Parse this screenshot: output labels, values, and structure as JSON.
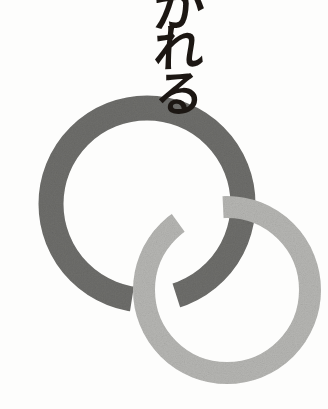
{
  "canvas": {
    "width": 328,
    "height": 409,
    "background_color": "#fdfdfc"
  },
  "caption": {
    "text": "かれる",
    "reading": "kareru",
    "orientation": "vertical",
    "color": "#1c1713",
    "characters": [
      "か",
      "れ",
      "る"
    ],
    "note": "top character is cropped by the top edge of the image"
  },
  "artwork": {
    "name": "two interlocking rings",
    "style": "halftone screened print",
    "rings": [
      {
        "id": "dark-ring",
        "label": "large dark gray ring",
        "color": "#6e6e6b",
        "center_x": 147,
        "center_y": 204,
        "radius": 96,
        "stroke_width": 25,
        "diameter": 217,
        "bounds": {
          "left": 39,
          "top": 96,
          "right": 255,
          "bottom": 312
        }
      },
      {
        "id": "light-ring",
        "label": "smaller light gray ring",
        "color": "#b6b6b3",
        "center_x": 227,
        "center_y": 290,
        "radius": 83,
        "stroke_width": 22,
        "diameter": 189,
        "bounds": {
          "left": 133,
          "top": 196,
          "right": 322,
          "bottom": 385
        }
      }
    ],
    "crossings": [
      {
        "id": "upper-crossing",
        "x": 200,
        "y": 215,
        "over": "dark-ring",
        "under": "light-ring"
      },
      {
        "id": "lower-crossing",
        "x": 155,
        "y": 305,
        "over": "light-ring",
        "under": "dark-ring"
      }
    ]
  }
}
